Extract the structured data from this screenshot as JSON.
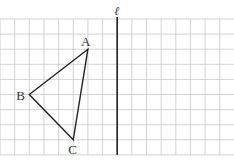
{
  "figure": {
    "grid": {
      "columns": 16,
      "rows": 9,
      "x0": 0,
      "y0": 19,
      "cell_w": 14.65,
      "cell_h": 15.1,
      "color": "#c8c8c8"
    },
    "line": {
      "label": "ℓ",
      "grid_col": 8,
      "color": "#222222"
    },
    "triangle": {
      "color": "#222222",
      "vertices": [
        {
          "label": "A",
          "grid_col": 6,
          "grid_row": 2
        },
        {
          "label": "B",
          "grid_col": 2,
          "grid_row": 5
        },
        {
          "label": "C",
          "grid_col": 5,
          "grid_row": 8
        }
      ]
    }
  }
}
